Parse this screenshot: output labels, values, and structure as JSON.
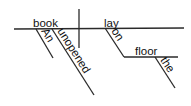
{
  "diagram": {
    "type": "sentence-diagram",
    "sentence": "An unopened book lay on the floor",
    "subject": "book",
    "verb": "lay",
    "subject_modifiers": [
      "An",
      "unopened"
    ],
    "preposition": "on",
    "prepositional_object": "floor",
    "object_modifiers": [
      "the"
    ],
    "line_color": "#2a2a2a",
    "text_color": "#111111"
  }
}
